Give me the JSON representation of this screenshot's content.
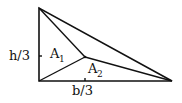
{
  "diagram": {
    "labels": {
      "h_third": "h/3",
      "b_third": "b/3",
      "a1_main": "A",
      "a1_sub": "1",
      "a2_main": "A",
      "a2_sub": "2"
    },
    "colors": {
      "stroke": "#111111",
      "background": "#ffffff"
    },
    "vertices": {
      "top": [
        39,
        8
      ],
      "bottom_left": [
        39,
        81
      ],
      "bottom_right": [
        172,
        81
      ],
      "interior": [
        85,
        57
      ]
    },
    "ticks": {
      "h_third": [
        40,
        56
      ],
      "b_third": [
        85,
        80
      ]
    }
  }
}
